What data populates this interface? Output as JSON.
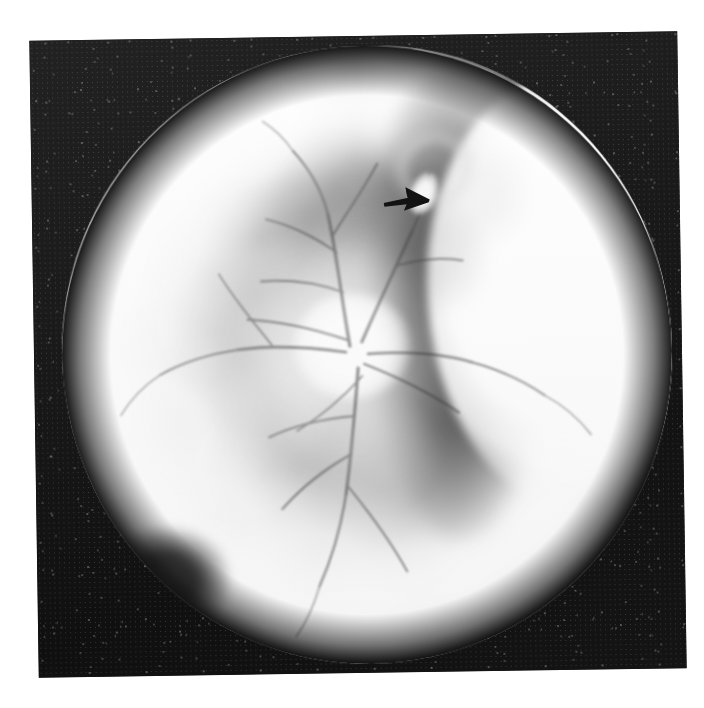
{
  "image": {
    "kind": "fundus-photograph",
    "modality": "Color fundus photography (reproduced in grayscale halftone print)",
    "orientation": "right-eye style view, optic disc left of center",
    "background_color": "#151515",
    "page_color": "#ffffff",
    "plate_rotation_degrees": -0.85
  },
  "annotations": {
    "arrow": {
      "name": "black-arrowhead",
      "direction": "right",
      "color": "#0d0d0d",
      "points_at": "focal pale lesion on the superior retina",
      "x": 350,
      "y": 148,
      "width": 52,
      "height": 34
    }
  },
  "features": {
    "optic_disc": {
      "label": "optic disc",
      "brightness": "blown-out white",
      "center_x_pct": 47.5,
      "center_y_pct": 48.5
    },
    "vessels": {
      "label": "retinal vessels",
      "description": "dark branching vessels radiating from the optic disc"
    },
    "peripheral_ring": {
      "label": "bright peripheral chorioretinal ring",
      "color": "#ffffff"
    },
    "right_crescent": {
      "label": "blown-out white crescent at temporal periphery",
      "color": "#ffffff"
    },
    "dark_band": {
      "label": "dark vertical band / shadow medial to the crescent",
      "color": "#5c5c5c"
    },
    "superior_lesion": {
      "label": "pale superior lesion indicated by the arrow",
      "color": "#f2f2f2"
    },
    "ring_gap": {
      "label": "dark interruption of the bright ring, inferotemporal",
      "color": "#1e1e1e"
    }
  },
  "geometry": {
    "plate": {
      "x": 34,
      "y": 36,
      "width": 648,
      "height": 637
    },
    "fundus": {
      "x": 28,
      "y": 10,
      "width": 610,
      "height": 618
    }
  }
}
